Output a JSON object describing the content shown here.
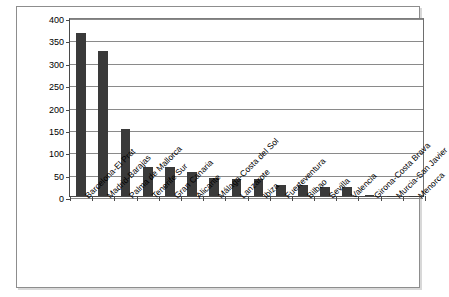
{
  "chart_data": {
    "type": "bar",
    "title": "",
    "subtitle": "",
    "xlabel": "",
    "ylabel": "",
    "ylim": [
      0,
      400
    ],
    "ytick_step": 50,
    "yticks": [
      "0",
      "50",
      "100",
      "150",
      "200",
      "250",
      "300",
      "350",
      "400"
    ],
    "grid": true,
    "legend": false,
    "legend_position": "none",
    "bar_color": "#3a3a3a",
    "axis_color": "#4a4a4a",
    "grid_color": "#8a8a8a",
    "frame_color": "#8d8d8d",
    "categories": [
      "Barcelona-El Prat",
      "Madrid-Barajas",
      "Palma de Mallorca",
      "Tenerife Sur",
      "Gran Canaria",
      "Alicante",
      "Málaga-Costa del Sol",
      "Lanzarote",
      "Ibiza",
      "Fuerteventura",
      "Bilbao",
      "Sevilla",
      "Valencia",
      "Girona-Costa Brava",
      "Murcia-San Javier",
      "Menorca"
    ],
    "values": [
      365,
      325,
      150,
      65,
      65,
      53,
      40,
      37,
      37,
      25,
      25,
      20,
      20,
      2,
      1,
      1
    ]
  }
}
